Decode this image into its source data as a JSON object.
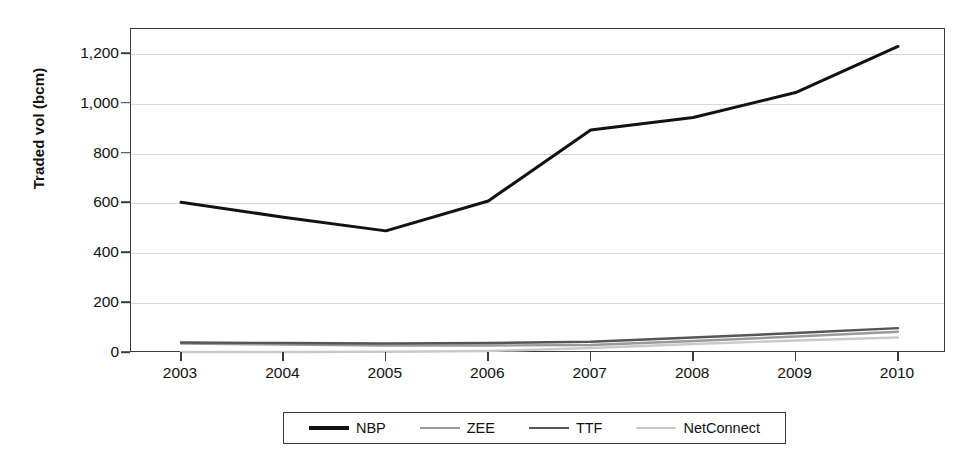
{
  "chart_data": {
    "type": "line",
    "title": "",
    "xlabel": "",
    "ylabel": "Traded vol (bcm)",
    "categories": [
      "2003",
      "2004",
      "2005",
      "2006",
      "2007",
      "2008",
      "2009",
      "2010"
    ],
    "x": [
      2003,
      2004,
      2005,
      2006,
      2007,
      2008,
      2009,
      2010
    ],
    "xlim": [
      2003,
      2010
    ],
    "ylim": [
      0,
      1300
    ],
    "yticks": [
      0,
      200,
      400,
      600,
      800,
      1000,
      1200
    ],
    "ytick_labels": [
      "0",
      "200",
      "400",
      "600",
      "800",
      "1,000",
      "1,200"
    ],
    "grid": true,
    "legend_position": "bottom",
    "series": [
      {
        "name": "NBP",
        "color": "#121212",
        "width": 3.0,
        "values": [
          605,
          545,
          490,
          610,
          895,
          945,
          1045,
          1230
        ]
      },
      {
        "name": "ZEE",
        "color": "#9a9a9a",
        "width": 2.4,
        "values": [
          38,
          34,
          30,
          30,
          32,
          48,
          66,
          85
        ]
      },
      {
        "name": "TTF",
        "color": "#555555",
        "width": 2.4,
        "values": [
          42,
          40,
          38,
          40,
          45,
          62,
          80,
          100
        ]
      },
      {
        "name": "NetConnect",
        "color": "#c9c9c9",
        "width": 2.4,
        "values": [
          4,
          4,
          5,
          8,
          20,
          36,
          50,
          62
        ]
      }
    ]
  },
  "axes": {
    "y_title": "Traded vol (bcm)"
  },
  "legend": {
    "entries": [
      {
        "label": "NBP"
      },
      {
        "label": "ZEE"
      },
      {
        "label": "TTF"
      },
      {
        "label": "NetConnect"
      }
    ]
  }
}
